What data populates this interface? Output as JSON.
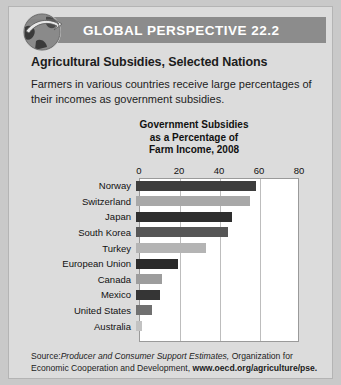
{
  "banner": {
    "title": "GLOBAL PERSPECTIVE 22.2",
    "icon": "globe-arrow-icon",
    "bg_color": "#8c8c8c",
    "text_color": "#ffffff"
  },
  "subject": {
    "title": "Agricultural Subsidies, Selected Nations",
    "intro": "Farmers in various countries receive large percentages of their incomes as government subsidies."
  },
  "source": {
    "label": "Source:",
    "italic_part": "Producer and Consumer Support Estimates,",
    "plain_part": " Organization for Economic Cooperation and Development, ",
    "url": "www.oecd.org/agriculture/pse."
  },
  "chart_data": {
    "type": "bar",
    "orientation": "horizontal",
    "title": "Government Subsidies as a Percentage of Farm Income, 2008",
    "title_lines": [
      "Government Subsidies",
      "as a Percentage of",
      "Farm Income, 2008"
    ],
    "xlabel": "",
    "ylabel": "",
    "xlim": [
      0,
      80
    ],
    "ticks": [
      0,
      20,
      40,
      60,
      80
    ],
    "tick_labels": [
      "0",
      "20",
      "40",
      "60",
      "80"
    ],
    "grid": true,
    "legend": "none",
    "categories": [
      "Norway",
      "Switzerland",
      "Japan",
      "South Korea",
      "Turkey",
      "European Union",
      "Canada",
      "Mexico",
      "United States",
      "Australia"
    ],
    "values": [
      60,
      57,
      48,
      46,
      35,
      21,
      13,
      12,
      8,
      3
    ],
    "bar_colors": [
      "#3d3d3d",
      "#a8a8a8",
      "#2e2e2e",
      "#565656",
      "#b4b4b4",
      "#2b2b2b",
      "#9d9d9d",
      "#353535",
      "#707070",
      "#c2c2c2"
    ]
  }
}
